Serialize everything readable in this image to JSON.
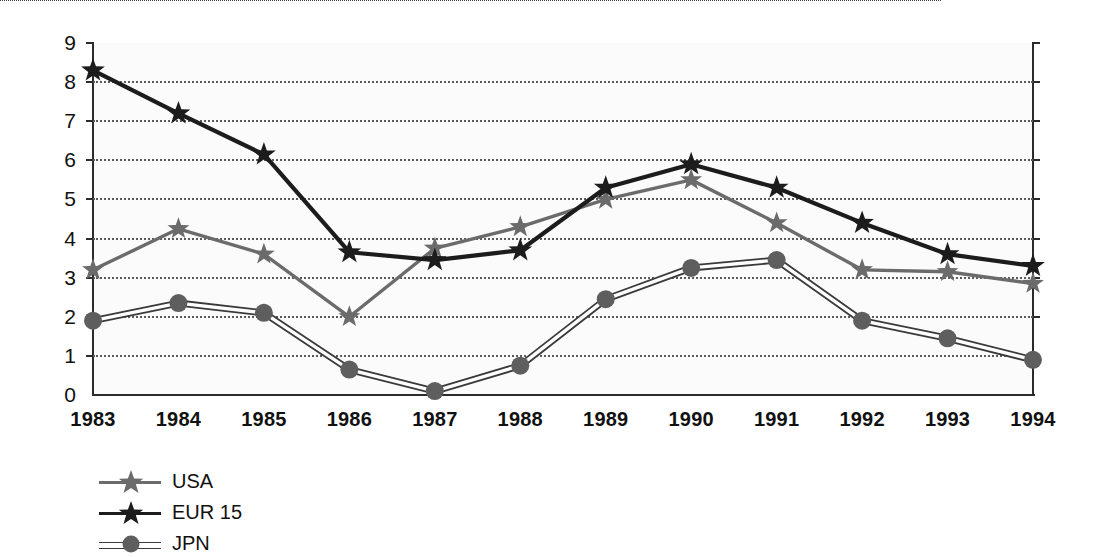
{
  "chart_data": {
    "type": "line",
    "title": "",
    "subtitle": "",
    "xlabel": "",
    "ylabel": "",
    "categories": [
      "1983",
      "1984",
      "1985",
      "1986",
      "1987",
      "1988",
      "1989",
      "1990",
      "1991",
      "1992",
      "1993",
      "1994"
    ],
    "xlim": [
      1983,
      1994
    ],
    "ylim": [
      0,
      9
    ],
    "yticks": [
      0,
      1,
      2,
      3,
      4,
      5,
      6,
      7,
      8,
      9
    ],
    "grid": true,
    "grid_style": "dotted-horizontal",
    "legend_position": "below-left",
    "series": [
      {
        "name": "USA",
        "marker": "star",
        "color": "#6b6b6b",
        "values": [
          3.2,
          4.25,
          3.6,
          2.0,
          3.75,
          4.3,
          5.0,
          5.5,
          4.4,
          3.2,
          3.15,
          2.85
        ]
      },
      {
        "name": "EUR 15",
        "marker": "star",
        "color": "#1c1c1c",
        "values": [
          8.3,
          7.2,
          6.15,
          3.65,
          3.45,
          3.7,
          5.3,
          5.9,
          5.3,
          4.4,
          3.6,
          3.3
        ]
      },
      {
        "name": "JPN",
        "marker": "circle",
        "color": "#5e5e5e",
        "values": [
          1.9,
          2.35,
          2.1,
          0.65,
          0.1,
          0.75,
          2.45,
          3.25,
          3.45,
          1.9,
          1.45,
          0.9
        ]
      }
    ]
  },
  "axis": {
    "y_tick_labels": [
      "0",
      "1",
      "2",
      "3",
      "4",
      "5",
      "6",
      "7",
      "8",
      "9"
    ],
    "x_tick_labels": [
      "1983",
      "1984",
      "1985",
      "1986",
      "1987",
      "1988",
      "1989",
      "1990",
      "1991",
      "1992",
      "1993",
      "1994"
    ]
  },
  "legend": {
    "items": [
      {
        "label": "USA",
        "marker": "star-icon",
        "color": "#6b6b6b"
      },
      {
        "label": "EUR 15",
        "marker": "star-icon",
        "color": "#1c1c1c"
      },
      {
        "label": "JPN",
        "marker": "circle-icon",
        "color": "#5e5e5e"
      }
    ]
  },
  "colors": {
    "usa": "#6b6b6b",
    "eur": "#1c1c1c",
    "jpn": "#5e5e5e",
    "grid": "#5a5a5a",
    "axis": "#2b2b2b",
    "plot_background": "#fbfbfb",
    "page_background": "#ffffff"
  }
}
